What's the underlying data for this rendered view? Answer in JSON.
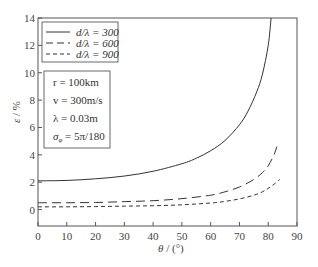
{
  "chart_data": {
    "type": "line",
    "title": "",
    "xlabel": "θ / (°)",
    "ylabel": "ε / %",
    "xlim": [
      0,
      90
    ],
    "ylim": [
      -1.2,
      14
    ],
    "xticks": [
      0,
      10,
      20,
      30,
      40,
      50,
      60,
      70,
      80,
      90
    ],
    "yticks": [
      0,
      2,
      4,
      6,
      8,
      10,
      12,
      14
    ],
    "grid": false,
    "legend_position": "upper-left",
    "series": [
      {
        "name": "d/λ = 300",
        "style": "solid",
        "x": [
          0,
          10,
          20,
          30,
          40,
          50,
          55,
          60,
          65,
          70,
          73,
          76,
          78,
          80,
          81
        ],
        "y": [
          2.1,
          2.13,
          2.25,
          2.45,
          2.8,
          3.35,
          3.75,
          4.3,
          5.05,
          6.2,
          7.2,
          8.6,
          9.9,
          12.0,
          14.0
        ]
      },
      {
        "name": "d/λ = 600",
        "style": "dashed-long",
        "x": [
          0,
          10,
          20,
          30,
          40,
          50,
          60,
          65,
          70,
          75,
          78,
          80,
          82,
          83
        ],
        "y": [
          0.5,
          0.5,
          0.52,
          0.58,
          0.65,
          0.8,
          1.05,
          1.3,
          1.65,
          2.2,
          2.7,
          3.2,
          4.0,
          4.6
        ]
      },
      {
        "name": "d/λ = 900",
        "style": "dashed-short",
        "x": [
          0,
          10,
          20,
          30,
          40,
          50,
          60,
          65,
          70,
          75,
          78,
          80,
          82,
          84
        ],
        "y": [
          0.2,
          0.2,
          0.22,
          0.25,
          0.28,
          0.35,
          0.48,
          0.6,
          0.78,
          1.05,
          1.3,
          1.55,
          1.85,
          2.2
        ]
      }
    ],
    "legend": [
      "d/λ = 300",
      "d/λ = 600",
      "d/λ = 900"
    ],
    "annotation_box": [
      "r = 100km",
      "v = 300m/s",
      "λ = 0.03m",
      "σφ = 5π/180"
    ]
  },
  "legend": {
    "items": [
      {
        "label": "d/λ = 300"
      },
      {
        "label": "d/λ = 600"
      },
      {
        "label": "d/λ = 900"
      }
    ]
  },
  "params": {
    "r": "r = 100km",
    "v": "v = 300m/s",
    "lambda": "λ = 0.03m",
    "sigma_sym": "σ",
    "sigma_sub": "φ",
    "sigma_rest": " = 5π/180"
  },
  "axes": {
    "x_label_theta": "θ",
    "x_label_rest": " / (°)",
    "y_label_eps": "ε",
    "y_label_rest": " / %"
  },
  "colors": {
    "line": "#333333",
    "axis": "#555555"
  }
}
